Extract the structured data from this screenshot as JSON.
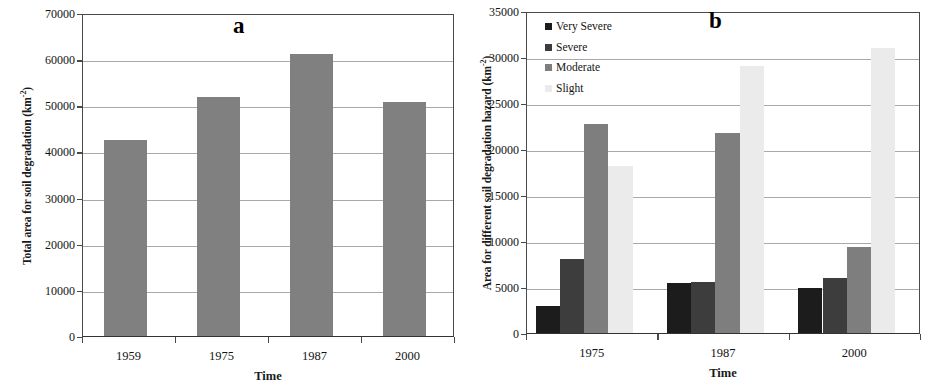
{
  "figure": {
    "panels": [
      "a",
      "b"
    ]
  },
  "panel_a": {
    "label": "a",
    "xtitle": "Time",
    "ytitle_main": "Total area for soil degradation (km",
    "ytitle_sup": "-2",
    "ytitle_end": ")",
    "bar_color": "#808080"
  },
  "panel_b": {
    "label": "b",
    "xtitle": "Time",
    "ytitle_main": "Area for different soil degradation hazard (km",
    "ytitle_sup": "-2",
    "ytitle_end": ")",
    "legend_title": ""
  },
  "chart_data": [
    {
      "type": "bar",
      "panel": "a",
      "title": "a",
      "xlabel": "Time",
      "ylabel": "Total area for soil degradation (km-2)",
      "categories": [
        "1959",
        "1975",
        "1987",
        "2000"
      ],
      "values": [
        42500,
        51700,
        61200,
        50800
      ],
      "ylim": [
        0,
        70000
      ],
      "yticks": [
        0,
        10000,
        20000,
        30000,
        40000,
        50000,
        60000,
        70000
      ],
      "ytick_labels": [
        "0",
        "10000",
        "20000",
        "30000",
        "40000",
        "50000",
        "60000",
        "70000"
      ],
      "grid": true,
      "legend": false,
      "series_color": "#808080"
    },
    {
      "type": "bar",
      "panel": "b",
      "title": "b",
      "xlabel": "Time",
      "ylabel": "Area for different soil degradation hazard (km-2)",
      "categories": [
        "1975",
        "1987",
        "2000"
      ],
      "series": [
        {
          "name": "Very Severe",
          "values": [
            2900,
            5400,
            4900
          ],
          "color": "#1c1c1c"
        },
        {
          "name": "Severe",
          "values": [
            8000,
            5500,
            6000
          ],
          "color": "#3d3d3d"
        },
        {
          "name": "Moderate",
          "values": [
            22700,
            21700,
            9300
          ],
          "color": "#7e7e7e"
        },
        {
          "name": "Slight",
          "values": [
            18100,
            29000,
            31000
          ],
          "color": "#ebebeb"
        }
      ],
      "ylim": [
        0,
        35000
      ],
      "yticks": [
        0,
        5000,
        10000,
        15000,
        20000,
        25000,
        30000,
        35000
      ],
      "ytick_labels": [
        "0",
        "5000",
        "10000",
        "15000",
        "20000",
        "25000",
        "30000",
        "35000"
      ],
      "grid": true,
      "legend": true,
      "legend_position": "top-left"
    }
  ]
}
